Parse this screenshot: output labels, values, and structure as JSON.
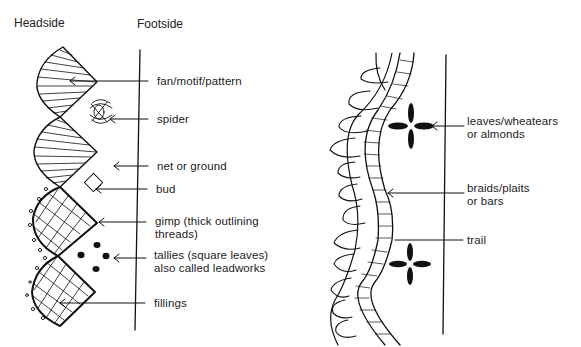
{
  "headers": {
    "headside": "Headside",
    "footside": "Footside"
  },
  "left_labels": [
    {
      "id": "fan",
      "lines": [
        "fan/motif/pattern"
      ]
    },
    {
      "id": "spider",
      "lines": [
        "spider"
      ]
    },
    {
      "id": "net",
      "lines": [
        "net or ground"
      ]
    },
    {
      "id": "bud",
      "lines": [
        "bud"
      ]
    },
    {
      "id": "gimp",
      "lines": [
        "gimp (thick outlining",
        "threads)"
      ]
    },
    {
      "id": "tallies",
      "lines": [
        "tallies (square leaves)",
        "also called leadworks"
      ]
    },
    {
      "id": "fillings",
      "lines": [
        "fillings"
      ]
    }
  ],
  "right_labels": [
    {
      "id": "leaves",
      "lines": [
        "leaves/wheatears",
        "or almonds"
      ]
    },
    {
      "id": "braids",
      "lines": [
        "braids/plaits",
        "or bars"
      ]
    },
    {
      "id": "trail",
      "lines": [
        "trail"
      ]
    }
  ]
}
